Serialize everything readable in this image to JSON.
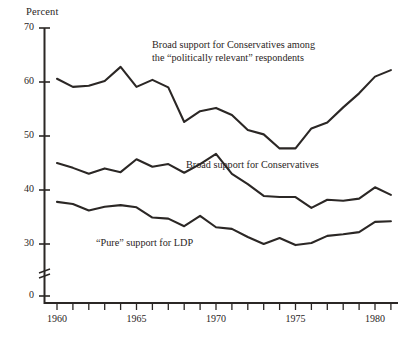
{
  "chart_data": {
    "type": "line",
    "title": "",
    "subtitle": "",
    "xlabel": "",
    "ylabel": "Percent",
    "xlim": [
      1959.3,
      1981.6
    ],
    "ylim": [
      30,
      70
    ],
    "y_break_below": 30,
    "grid": false,
    "legend": "inline-annotations",
    "yticks": [
      70,
      60,
      50,
      40,
      30,
      0
    ],
    "ytick_labels": [
      "70",
      "60",
      "50",
      "40",
      "30",
      "0"
    ],
    "xticks": [
      1960,
      1961,
      1962,
      1963,
      1964,
      1965,
      1966,
      1967,
      1968,
      1969,
      1970,
      1971,
      1972,
      1973,
      1974,
      1975,
      1976,
      1977,
      1978,
      1979,
      1980,
      1981
    ],
    "xtick_labels": [
      "1960",
      "1965",
      "1970",
      "1975",
      "1980"
    ],
    "xtick_labels_at": [
      1960,
      1965,
      1970,
      1975,
      1980
    ],
    "series": [
      {
        "name": "Broad support for Conservatives among the \"politically relevant\" respondents",
        "x": [
          1960,
          1961,
          1962,
          1963,
          1964,
          1965,
          1966,
          1967,
          1968,
          1969,
          1970,
          1971,
          1972,
          1973,
          1974,
          1975,
          1976,
          1977,
          1978,
          1979,
          1980,
          1981
        ],
        "values": [
          60.6,
          59.1,
          59.3,
          60.2,
          62.8,
          59.1,
          60.4,
          59.0,
          52.6,
          54.6,
          55.2,
          53.9,
          51.1,
          50.3,
          47.7,
          47.7,
          51.4,
          52.5,
          55.3,
          57.9,
          61.0,
          62.2
        ]
      },
      {
        "name": "Broad support for Conservatives",
        "x": [
          1960,
          1961,
          1962,
          1963,
          1964,
          1965,
          1966,
          1967,
          1968,
          1969,
          1970,
          1971,
          1972,
          1973,
          1974,
          1975,
          1976,
          1977,
          1978,
          1979,
          1980,
          1981
        ],
        "values": [
          45.0,
          44.1,
          43.0,
          44.0,
          43.3,
          45.7,
          44.3,
          44.8,
          43.2,
          44.8,
          46.7,
          43.0,
          41.1,
          38.9,
          38.7,
          38.7,
          36.7,
          38.2,
          38.0,
          38.4,
          40.5,
          39.1
        ]
      },
      {
        "name": "\"Pure\" support for LDP",
        "x": [
          1960,
          1961,
          1962,
          1963,
          1964,
          1965,
          1966,
          1967,
          1968,
          1969,
          1970,
          1971,
          1972,
          1973,
          1974,
          1975,
          1976,
          1977,
          1978,
          1979,
          1980,
          1981
        ],
        "values": [
          37.8,
          37.4,
          36.2,
          36.9,
          37.2,
          36.8,
          34.9,
          34.7,
          33.3,
          35.2,
          33.1,
          32.8,
          31.3,
          30.0,
          31.1,
          29.8,
          30.2,
          31.5,
          31.8,
          32.2,
          34.1,
          34.2
        ]
      }
    ],
    "annotations": [
      {
        "id": "annot-top",
        "text": "Broad support for Conservatives among\nthe “politically relevant” respondents"
      },
      {
        "id": "annot-mid",
        "text": "Broad support for Conservatives"
      },
      {
        "id": "annot-low",
        "text": "“Pure” support for LDP"
      }
    ],
    "line_color": "#2b2725",
    "axis_color": "#2b2725"
  },
  "axis": {
    "y_title": "Percent",
    "y_labels": [
      "70",
      "60",
      "50",
      "40",
      "30",
      "0"
    ],
    "x_labels": [
      "1960",
      "1965",
      "1970",
      "1975",
      "1980"
    ]
  },
  "annotations": {
    "top_line1": "Broad support for Conservatives among",
    "top_line2": "the “politically relevant” respondents",
    "mid": "Broad support for Conservatives",
    "low": "“Pure” support for LDP"
  }
}
